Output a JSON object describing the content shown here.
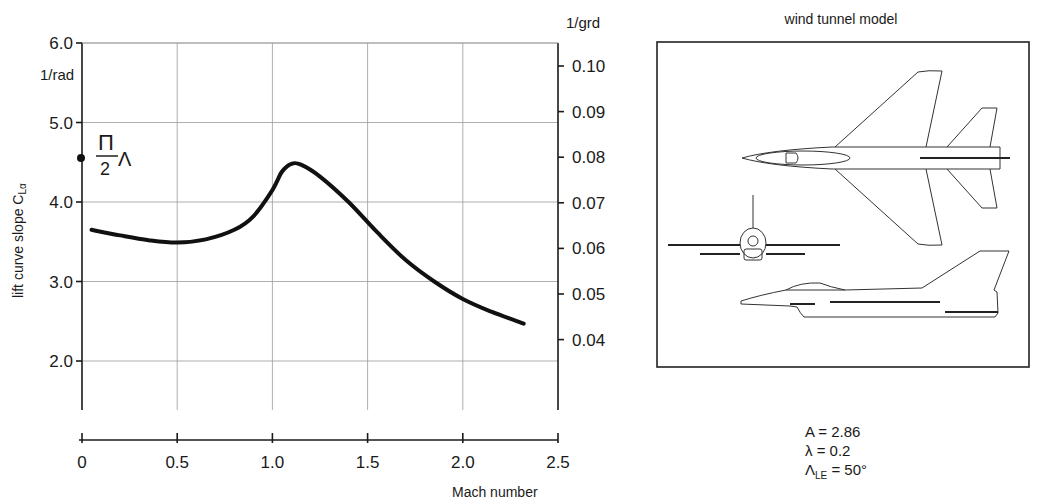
{
  "chart_data": {
    "type": "line",
    "title": "",
    "xlabel": "Mach number",
    "ylabel": "lift curve slope C_Lα",
    "y_unit_left": "1/rad",
    "y_unit_right": "1/grd",
    "xlim": [
      0,
      2.5
    ],
    "ylim": [
      1.5,
      6.0
    ],
    "x_ticks": [
      "0",
      "0.5",
      "1.0",
      "1.5",
      "2.0",
      "2.5"
    ],
    "y_ticks_left": [
      "6.0",
      "5.0",
      "4.0",
      "3.0",
      "2.0"
    ],
    "y_ticks_right": [
      "0.10",
      "0.09",
      "0.08",
      "0.07",
      "0.06",
      "0.05",
      "0.04"
    ],
    "grid": true,
    "annotation": {
      "text": "π/2 Λ",
      "marker_value": 4.5,
      "description": "theoretical slope π/2·A marker on y-axis"
    },
    "series": [
      {
        "name": "C_Lα",
        "x": [
          0.05,
          0.2,
          0.35,
          0.5,
          0.65,
          0.8,
          0.9,
          1.0,
          1.05,
          1.1,
          1.15,
          1.25,
          1.4,
          1.55,
          1.7,
          1.85,
          2.0,
          2.15,
          2.32
        ],
        "values": [
          3.65,
          3.58,
          3.52,
          3.49,
          3.53,
          3.65,
          3.82,
          4.15,
          4.38,
          4.48,
          4.47,
          4.32,
          4.0,
          3.62,
          3.27,
          3.0,
          2.78,
          2.62,
          2.47
        ]
      }
    ]
  },
  "model_panel": {
    "title": "wind tunnel model",
    "views": [
      "top-view",
      "front-view",
      "side-view"
    ]
  },
  "parameters": {
    "aspect_ratio": "A = 2.86",
    "taper_ratio": "λ = 0.2",
    "sweep_symbol": "Λ",
    "sweep_sub": "LE",
    "sweep_value": " = 50°"
  }
}
